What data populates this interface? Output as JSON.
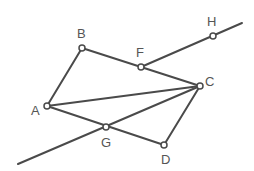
{
  "diagram": {
    "type": "geometry",
    "line_color": "#4a4a4a",
    "label_color": "#555555",
    "points": [
      {
        "id": "A",
        "label": "A",
        "x": 47,
        "y": 106,
        "lx": 31,
        "ly": 115
      },
      {
        "id": "B",
        "label": "B",
        "x": 82,
        "y": 48,
        "lx": 77,
        "ly": 38
      },
      {
        "id": "F",
        "label": "F",
        "x": 141,
        "y": 67,
        "lx": 136,
        "ly": 57
      },
      {
        "id": "C",
        "label": "C",
        "x": 200,
        "y": 86,
        "lx": 205,
        "ly": 86
      },
      {
        "id": "H",
        "label": "H",
        "x": 213,
        "y": 36,
        "lx": 207,
        "ly": 26
      },
      {
        "id": "G",
        "label": "G",
        "x": 106,
        "y": 127,
        "lx": 101,
        "ly": 147
      },
      {
        "id": "D",
        "label": "D",
        "x": 164,
        "y": 145,
        "lx": 161,
        "ly": 164
      }
    ],
    "segments": [
      {
        "name": "segment-AB",
        "x1": 47,
        "y1": 106,
        "x2": 82,
        "y2": 48
      },
      {
        "name": "segment-BC",
        "x1": 82,
        "y1": 48,
        "x2": 200,
        "y2": 86
      },
      {
        "name": "segment-AC",
        "x1": 47,
        "y1": 106,
        "x2": 200,
        "y2": 86
      },
      {
        "name": "segment-AD",
        "x1": 47,
        "y1": 106,
        "x2": 164,
        "y2": 145
      },
      {
        "name": "segment-CD",
        "x1": 200,
        "y1": 86,
        "x2": 164,
        "y2": 145
      },
      {
        "name": "line-FH",
        "x1": 141,
        "y1": 67,
        "x2": 242,
        "y2": 23
      },
      {
        "name": "line-through-G",
        "x1": 18,
        "y1": 164,
        "x2": 200,
        "y2": 86
      }
    ]
  }
}
